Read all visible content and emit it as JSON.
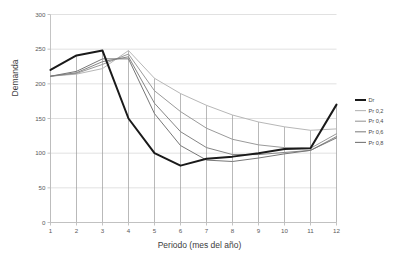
{
  "chart_data": {
    "type": "line",
    "title": "",
    "xlabel": "Periodo (mes del año)",
    "ylabel": "Demanda",
    "x": [
      1,
      2,
      3,
      4,
      5,
      6,
      7,
      8,
      9,
      10,
      11,
      12
    ],
    "xtick_labels": [
      "1",
      "2",
      "3",
      "4",
      "5",
      "6",
      "7",
      "8",
      "9",
      "10",
      "11",
      "12"
    ],
    "ytick_labels": [
      "0",
      "50",
      "100",
      "150",
      "200",
      "250",
      "300"
    ],
    "yticks": [
      0,
      50,
      100,
      150,
      200,
      250,
      300
    ],
    "ylim": [
      0,
      300
    ],
    "xlim": [
      1,
      12
    ],
    "grid": "horizontal-and-vertical-droplines",
    "legend_position": "right",
    "series": [
      {
        "name": "Dr",
        "color": "#1a1a1a",
        "width": 2.0,
        "values": [
          220,
          241,
          248,
          150,
          100,
          82,
          92,
          95,
          100,
          106,
          107,
          170
        ]
      },
      {
        "name": "Pr 0,2",
        "color": "#b7b7b7",
        "width": 1.0,
        "values": [
          211,
          214,
          222,
          248,
          208,
          186,
          169,
          155,
          145,
          138,
          133,
          135
        ]
      },
      {
        "name": "Pr 0,4",
        "color": "#9a9a9a",
        "width": 1.0,
        "values": [
          211,
          215,
          228,
          243,
          190,
          160,
          136,
          120,
          112,
          108,
          107,
          128
        ]
      },
      {
        "name": "Pr 0,6",
        "color": "#858585",
        "width": 1.0,
        "values": [
          211,
          216,
          232,
          239,
          172,
          131,
          108,
          98,
          98,
          101,
          104,
          124
        ]
      },
      {
        "name": "Pr 0,8",
        "color": "#777777",
        "width": 1.0,
        "values": [
          211,
          218,
          236,
          236,
          157,
          111,
          90,
          88,
          93,
          99,
          104,
          122
        ]
      }
    ]
  },
  "legend": {
    "entries": [
      {
        "label": "Dr"
      },
      {
        "label": "Pr 0,2"
      },
      {
        "label": "Pr 0,4"
      },
      {
        "label": "Pr 0,6"
      },
      {
        "label": "Pr 0,8"
      }
    ]
  },
  "axes": {
    "y_title": "Demanda",
    "x_title": "Periodo (mes del año)"
  }
}
